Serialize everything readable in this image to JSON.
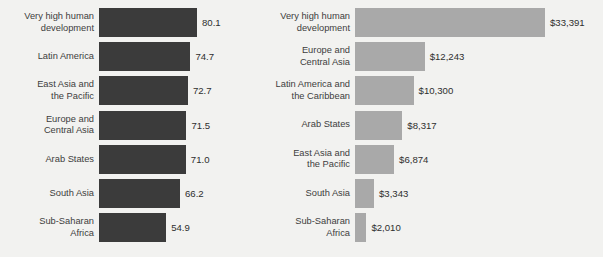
{
  "figure": {
    "background_color": "#f2f2f0",
    "panels": [
      {
        "id": "life-expectancy",
        "bar_color": "#3b3b3b",
        "bars": [
          {
            "label": "Very high human\ndevelopment",
            "value": 80.1,
            "display": "80.1"
          },
          {
            "label": "Latin America",
            "value": 74.7,
            "display": "74.7"
          },
          {
            "label": "East Asia and\nthe Pacific",
            "value": 72.7,
            "display": "72.7"
          },
          {
            "label": "Europe and\nCentral Asia",
            "value": 71.5,
            "display": "71.5"
          },
          {
            "label": "Arab States",
            "value": 71.0,
            "display": "71.0"
          },
          {
            "label": "South Asia",
            "value": 66.2,
            "display": "66.2"
          },
          {
            "label": "Sub-Saharan\nAfrica",
            "value": 54.9,
            "display": "54.9"
          }
        ]
      },
      {
        "id": "gross-national-income",
        "bar_color": "#a9a9a9",
        "bars": [
          {
            "label": "Very high human\ndevelopment",
            "value": 33391,
            "display": "$33,391"
          },
          {
            "label": "Europe and\nCentral Asia",
            "value": 12243,
            "display": "$12,243"
          },
          {
            "label": "Latin America and\nthe Caribbean",
            "value": 10300,
            "display": "$10,300"
          },
          {
            "label": "Arab States",
            "value": 8317,
            "display": "$8,317"
          },
          {
            "label": "East Asia and\nthe Pacific",
            "value": 6874,
            "display": "$6,874"
          },
          {
            "label": "South Asia",
            "value": 3343,
            "display": "$3,343"
          },
          {
            "label": "Sub-Saharan\nAfrica",
            "value": 2010,
            "display": "$2,010"
          }
        ]
      }
    ]
  },
  "chart_data": [
    {
      "type": "bar",
      "orientation": "horizontal",
      "title": "",
      "xlabel": "",
      "ylabel": "",
      "grid": false,
      "legend": "none",
      "bar_color": "#3b3b3b",
      "value_labels": true,
      "categories": [
        "Very high human development",
        "Latin America",
        "East Asia and the Pacific",
        "Europe and Central Asia",
        "Arab States",
        "South Asia",
        "Sub-Saharan Africa"
      ],
      "values": [
        80.1,
        74.7,
        72.7,
        71.5,
        71.0,
        66.2,
        54.9
      ],
      "value_label_text": [
        "80.1",
        "74.7",
        "72.7",
        "71.5",
        "71.0",
        "66.2",
        "54.9"
      ],
      "xlim": [
        0,
        80.1
      ]
    },
    {
      "type": "bar",
      "orientation": "horizontal",
      "title": "",
      "xlabel": "",
      "ylabel": "",
      "grid": false,
      "legend": "none",
      "bar_color": "#a9a9a9",
      "value_labels": true,
      "categories": [
        "Very high human development",
        "Europe and Central Asia",
        "Latin America and the Caribbean",
        "Arab States",
        "East Asia and the Pacific",
        "South Asia",
        "Sub-Saharan Africa"
      ],
      "values": [
        33391,
        12243,
        10300,
        8317,
        6874,
        3343,
        2010
      ],
      "value_label_text": [
        "$33,391",
        "$12,243",
        "$10,300",
        "$8,317",
        "$6,874",
        "$3,343",
        "$2,010"
      ],
      "xlim": [
        0,
        33391
      ]
    }
  ]
}
